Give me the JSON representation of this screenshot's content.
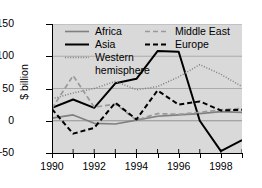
{
  "chart_data": {
    "type": "line",
    "title": "",
    "xlabel": "",
    "ylabel": "$ billion",
    "xlim": [
      1990,
      1999
    ],
    "ylim": [
      -50,
      150
    ],
    "yticks": [
      150,
      100,
      50,
      0,
      -50
    ],
    "xticks": [
      1990,
      1991,
      1992,
      1993,
      1994,
      1995,
      1996,
      1997,
      1998,
      1999
    ],
    "xtick_labels_shown": [
      "1990",
      "1992",
      "1994",
      "1996",
      "1998"
    ],
    "grid": "horizontal",
    "legend_position": "top-left-inside",
    "x": [
      1990,
      1991,
      1992,
      1993,
      1994,
      1995,
      1996,
      1997,
      1998,
      1999
    ],
    "series": [
      {
        "name": "Africa",
        "style": "solid",
        "color": "#808080",
        "values": [
          4,
          9,
          -4,
          -5,
          1,
          7,
          9,
          11,
          14,
          13
        ]
      },
      {
        "name": "Asia",
        "style": "solid",
        "color": "#000000",
        "values": [
          20,
          33,
          20,
          58,
          65,
          108,
          107,
          0,
          -47,
          -30
        ]
      },
      {
        "name": "Western hemisphere",
        "style": "dotted",
        "color": "#808080",
        "values": [
          34,
          43,
          50,
          61,
          48,
          53,
          68,
          87,
          72,
          53
        ]
      },
      {
        "name": "Middle East",
        "style": "dashed",
        "color": "#999999",
        "values": [
          19,
          70,
          21,
          26,
          1,
          11,
          10,
          13,
          17,
          19
        ]
      },
      {
        "name": "Europe",
        "style": "dashed",
        "color": "#000000",
        "values": [
          18,
          -20,
          -11,
          28,
          2,
          47,
          25,
          30,
          16,
          17
        ]
      }
    ]
  },
  "axis": {
    "ylabel": "$ billion",
    "ytick_labels": [
      "150",
      "100",
      "50",
      "0",
      "−50"
    ],
    "xtick_labels": [
      "1990",
      "1992",
      "1994",
      "1996",
      "1998"
    ]
  },
  "legend": {
    "africa": "Africa",
    "asia": "Asia",
    "western": "Western",
    "hemisphere": "hemisphere",
    "middle_east": "Middle East",
    "europe": "Europe"
  }
}
